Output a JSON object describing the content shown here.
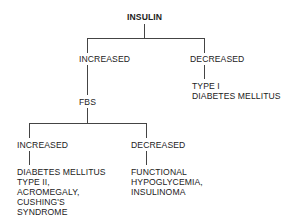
{
  "diagram": {
    "type": "tree",
    "root": "INSULIN",
    "level1": {
      "left": "INCREASED",
      "right": "DECREASED",
      "right_child": [
        "TYPE I",
        "DIABETES MELLITUS"
      ],
      "left_child": "FBS"
    },
    "level2": {
      "left": "INCREASED",
      "right": "DECREASED",
      "left_child": [
        "DIABETES MELLITUS",
        "TYPE II,",
        "ACROMEGALY,",
        "CUSHING'S",
        "SYNDROME"
      ],
      "right_child": [
        "FUNCTIONAL",
        "HYPOGLYCEMIA,",
        "INSULINOMA"
      ]
    }
  }
}
